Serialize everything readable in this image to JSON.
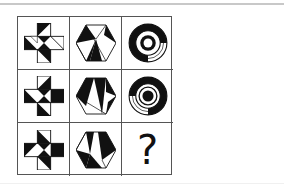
{
  "puzzle": {
    "grid": {
      "rows": 3,
      "cols": 3,
      "cells": [
        {
          "row": 1,
          "col": 1,
          "shape": "cross-icon",
          "fill": "black-white triangles"
        },
        {
          "row": 1,
          "col": 2,
          "shape": "hexagon-icon",
          "fill": "black-white triangles"
        },
        {
          "row": 1,
          "col": 3,
          "shape": "concentric-rings-icon",
          "fill": "black-white segments"
        },
        {
          "row": 2,
          "col": 1,
          "shape": "cross-icon",
          "fill": "black-white triangles"
        },
        {
          "row": 2,
          "col": 2,
          "shape": "hexagon-icon",
          "fill": "black-white triangles"
        },
        {
          "row": 2,
          "col": 3,
          "shape": "concentric-rings-icon",
          "fill": "black-white segments"
        },
        {
          "row": 3,
          "col": 1,
          "shape": "cross-icon",
          "fill": "black-white triangles"
        },
        {
          "row": 3,
          "col": 2,
          "shape": "hexagon-icon",
          "fill": "black-white triangles"
        },
        {
          "row": 3,
          "col": 3,
          "shape": "question-mark",
          "label": "?"
        }
      ]
    },
    "missing_label": "?",
    "colors": {
      "ink": "#111111",
      "border": "#555555",
      "background": "#ffffff"
    }
  }
}
